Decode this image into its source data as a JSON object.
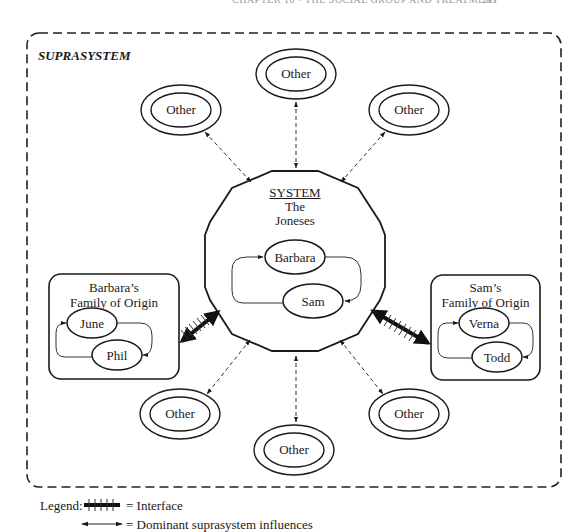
{
  "page": {
    "running_header": "CHAPTER 10 • THE SOCIAL GROUP AND TREATMENT",
    "page_number": "287"
  },
  "diagram": {
    "suprasystem_label": "SUPRASYSTEM",
    "system": {
      "title": "SYSTEM",
      "name_line1": "The",
      "name_line2": "Joneses",
      "members": [
        "Barbara",
        "Sam"
      ]
    },
    "left_family": {
      "title_line1": "Barbara’s",
      "title_line2": "Family of Origin",
      "members": [
        "June",
        "Phil"
      ]
    },
    "right_family": {
      "title_line1": "Sam’s",
      "title_line2": "Family of Origin",
      "members": [
        "Verna",
        "Todd"
      ]
    },
    "other_nodes": [
      "Other",
      "Other",
      "Other",
      "Other",
      "Other",
      "Other"
    ]
  },
  "legend": {
    "prefix": "Legend:",
    "interface_label": "= Interface",
    "influence_label": "= Dominant suprasystem influences"
  }
}
